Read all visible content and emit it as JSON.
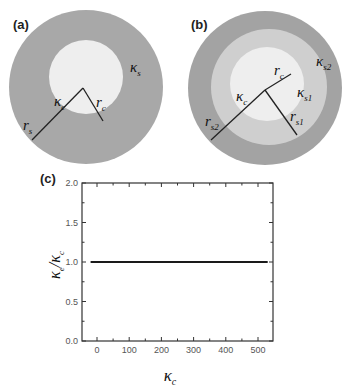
{
  "panels": {
    "a": {
      "label": "(a)",
      "shell_symbol": "κ",
      "shell_sub": "s",
      "core_symbol": "κ",
      "core_sub": "c",
      "core_radius_symbol": "r",
      "core_radius_sub": "c",
      "shell_radius_symbol": "r",
      "shell_radius_sub": "s",
      "colors": {
        "shell": "#a8a8a8",
        "core": "#eeeeee"
      }
    },
    "b": {
      "label": "(b)",
      "outer_shell_symbol": "κ",
      "outer_shell_sub": "s2",
      "inner_shell_symbol": "κ",
      "inner_shell_sub": "s1",
      "core_symbol": "κ",
      "core_sub": "c",
      "core_radius_symbol": "r",
      "core_radius_sub": "c",
      "inner_radius_symbol": "r",
      "inner_radius_sub": "s1",
      "outer_radius_symbol": "r",
      "outer_radius_sub": "s2",
      "colors": {
        "outer_shell": "#a3a3a3",
        "inner_shell": "#cfcfcf",
        "core": "#eeeeee"
      }
    },
    "c": {
      "label": "(c)"
    }
  },
  "chart_data": {
    "type": "line",
    "title": "",
    "xlabel": "κc",
    "ylabel": "κe/κc",
    "xlim": [
      -30,
      550
    ],
    "ylim": [
      0.0,
      2.0
    ],
    "x_ticks": [
      0,
      100,
      200,
      300,
      400,
      500
    ],
    "x_tick_labels": [
      "0",
      "100",
      "200",
      "300",
      "400",
      "500"
    ],
    "y_ticks": [
      0.0,
      0.5,
      1.0,
      1.5,
      2.0
    ],
    "y_tick_labels": [
      "0.0",
      "0.5",
      "1.0",
      "1.5",
      "2.0"
    ],
    "grid": false,
    "legend": null,
    "series": [
      {
        "name": "ratio",
        "x": [
          -20,
          0,
          100,
          200,
          300,
          400,
          500,
          530
        ],
        "y": [
          1.0,
          1.0,
          1.0,
          1.0,
          1.0,
          1.0,
          1.0,
          1.0
        ]
      }
    ]
  }
}
